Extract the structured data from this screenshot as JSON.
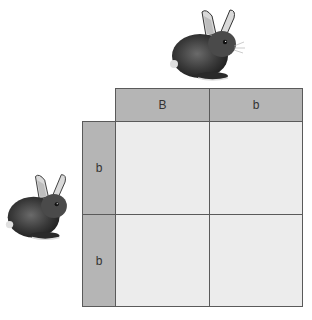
{
  "parents": {
    "top": {
      "icon": "rabbit-icon",
      "alleles": [
        "B",
        "b"
      ]
    },
    "left": {
      "icon": "rabbit-icon",
      "alleles": [
        "b",
        "b"
      ]
    }
  },
  "grid": {
    "columns": [
      "B",
      "b"
    ],
    "rows": [
      "b",
      "b"
    ],
    "cells": [
      [
        "",
        ""
      ],
      [
        "",
        ""
      ]
    ]
  },
  "colors": {
    "header_bg": "#b5b5b5",
    "cell_bg": "#ececec",
    "border": "#5a5a5a",
    "rabbit_fur": "#3a3a3a"
  }
}
